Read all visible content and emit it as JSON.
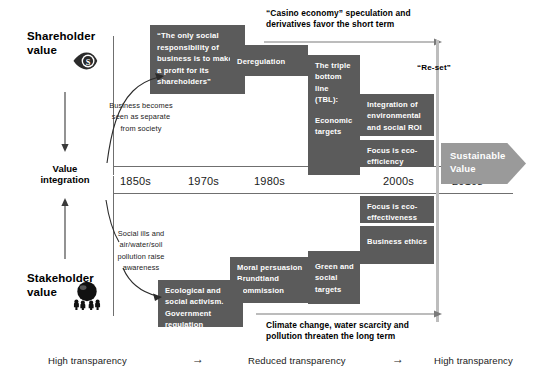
{
  "axis_labels": {
    "top_left": "Shareholder\nvalue",
    "top_left_line1": "Shareholder",
    "top_left_line2": "value",
    "middle_line1": "Value",
    "middle_line2": "integration",
    "bottom_left_line1": "Stakeholder",
    "bottom_left_line2": "value",
    "shareholder_icon": "eye-dollar-icon",
    "stakeholder_icon": "people-globe-icon"
  },
  "timeline": {
    "decades": [
      "1850s",
      "1970s",
      "1980s",
      "1990s",
      "2000s",
      "2010s"
    ]
  },
  "captions": {
    "top": "“Casino economy” speculation and\nderivatives favor the short term",
    "top_line1": "“Casino economy” speculation and",
    "top_line2": "derivatives favor the short term",
    "bottom_line1": "Climate change, water scarcity and",
    "bottom_line2": "pollution threaten the long term",
    "reset": "“Re-set”"
  },
  "notes": {
    "business_becomes_l1": "Business becomes",
    "business_becomes_l2": "seen as separate",
    "business_becomes_l3": "from society",
    "social_ills_l1": "Social ills and",
    "social_ills_l2": "air/water/soil",
    "social_ills_l3": "pollution raise",
    "social_ills_l4": "awareness"
  },
  "boxes": {
    "friedman_quote": "“The only social responsibility of business is to make a profit for its shareholders”",
    "deregulation": "Deregulation",
    "tbl_l1": "The triple bottom line (TBL):",
    "tbl_l2": "Economic targets",
    "integration_roi": "Integration of environmental and social ROI",
    "eco_efficiency": "Focus is eco-efficiency",
    "eco_effectiveness": "Focus is eco-effectiveness",
    "business_ethics": "Business ethics",
    "green_social_targets": "Green and social targets",
    "moral_persuasion": "Moral persuasion Brundtland Commission",
    "ecological_activism": "Ecological and social activism. Government regulation"
  },
  "sustainable_value": {
    "line1": "Sustainable",
    "line2": "Value"
  },
  "transparency": {
    "left": "High transparency",
    "arrow1": "→",
    "middle": "Reduced transparency",
    "arrow2": "→",
    "right": "High transparency"
  },
  "colors": {
    "box_fill": "#5b5b5b",
    "box_text": "#ffffff",
    "axis": "#6f6f6f",
    "reset_line": "#bdbdbd",
    "sustainable_arrow": "#9a9a9a",
    "background": "#ffffff"
  }
}
